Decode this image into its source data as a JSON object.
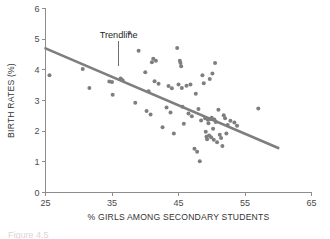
{
  "figure": {
    "caption_clipped": "Figure 4.5"
  },
  "chart_data": {
    "type": "scatter",
    "title": "",
    "xlabel": "% GIRLS AMONG SECONDARY STUDENTS",
    "ylabel": "BIRTH RATES (%)",
    "xlim": [
      25,
      65
    ],
    "ylim": [
      0,
      6
    ],
    "xticks": [
      25,
      35,
      45,
      55,
      65
    ],
    "yticks": [
      0,
      1,
      2,
      3,
      4,
      5,
      6
    ],
    "grid": false,
    "legend": null,
    "marker_color": "#7e7e80",
    "trendline_color": "#7e7e80",
    "axis_color": "#8d8d8d",
    "annotations": [
      {
        "label": "Trendline",
        "x": 36.0,
        "y": 5.05,
        "leader_to_x": 36.0,
        "leader_to_y": 4.12
      }
    ],
    "trendline": {
      "x": [
        25.0,
        60.0
      ],
      "y": [
        4.7,
        1.45
      ]
    },
    "points": [
      {
        "x": 25.6,
        "y": 3.82
      },
      {
        "x": 30.6,
        "y": 4.03
      },
      {
        "x": 31.6,
        "y": 3.41
      },
      {
        "x": 34.6,
        "y": 3.62
      },
      {
        "x": 35.0,
        "y": 3.6
      },
      {
        "x": 35.1,
        "y": 3.19
      },
      {
        "x": 36.3,
        "y": 3.72
      },
      {
        "x": 36.6,
        "y": 3.66
      },
      {
        "x": 37.6,
        "y": 5.21
      },
      {
        "x": 38.5,
        "y": 2.93
      },
      {
        "x": 39.0,
        "y": 4.62
      },
      {
        "x": 40.0,
        "y": 3.92
      },
      {
        "x": 40.2,
        "y": 2.66
      },
      {
        "x": 40.5,
        "y": 3.3
      },
      {
        "x": 40.8,
        "y": 2.54
      },
      {
        "x": 41.0,
        "y": 4.25
      },
      {
        "x": 41.2,
        "y": 4.36
      },
      {
        "x": 41.4,
        "y": 3.63
      },
      {
        "x": 41.6,
        "y": 4.3
      },
      {
        "x": 42.0,
        "y": 3.55
      },
      {
        "x": 42.6,
        "y": 2.13
      },
      {
        "x": 43.2,
        "y": 2.77
      },
      {
        "x": 43.5,
        "y": 3.47
      },
      {
        "x": 43.8,
        "y": 2.61
      },
      {
        "x": 44.0,
        "y": 3.4
      },
      {
        "x": 44.3,
        "y": 1.92
      },
      {
        "x": 44.8,
        "y": 4.71
      },
      {
        "x": 45.0,
        "y": 3.52
      },
      {
        "x": 45.2,
        "y": 4.3
      },
      {
        "x": 45.3,
        "y": 4.22
      },
      {
        "x": 45.4,
        "y": 4.12
      },
      {
        "x": 45.5,
        "y": 3.41
      },
      {
        "x": 45.6,
        "y": 2.8
      },
      {
        "x": 45.8,
        "y": 2.24
      },
      {
        "x": 46.2,
        "y": 3.48
      },
      {
        "x": 46.5,
        "y": 2.58
      },
      {
        "x": 46.8,
        "y": 3.52
      },
      {
        "x": 47.0,
        "y": 2.49
      },
      {
        "x": 47.4,
        "y": 1.43
      },
      {
        "x": 47.6,
        "y": 3.22
      },
      {
        "x": 47.8,
        "y": 1.33
      },
      {
        "x": 48.0,
        "y": 2.72
      },
      {
        "x": 48.2,
        "y": 1.02
      },
      {
        "x": 48.4,
        "y": 2.35
      },
      {
        "x": 48.6,
        "y": 3.82
      },
      {
        "x": 48.8,
        "y": 3.56
      },
      {
        "x": 49.0,
        "y": 2.42
      },
      {
        "x": 49.1,
        "y": 1.98
      },
      {
        "x": 49.2,
        "y": 1.82
      },
      {
        "x": 49.3,
        "y": 1.74
      },
      {
        "x": 49.4,
        "y": 2.37
      },
      {
        "x": 49.5,
        "y": 2.26
      },
      {
        "x": 49.6,
        "y": 1.86
      },
      {
        "x": 49.7,
        "y": 3.7
      },
      {
        "x": 49.8,
        "y": 2.4
      },
      {
        "x": 49.9,
        "y": 1.8
      },
      {
        "x": 50.0,
        "y": 2.44
      },
      {
        "x": 50.1,
        "y": 3.88
      },
      {
        "x": 50.2,
        "y": 2.08
      },
      {
        "x": 50.3,
        "y": 1.72
      },
      {
        "x": 50.4,
        "y": 2.38
      },
      {
        "x": 50.5,
        "y": 4.22
      },
      {
        "x": 50.6,
        "y": 2.3
      },
      {
        "x": 50.8,
        "y": 1.64
      },
      {
        "x": 51.0,
        "y": 2.7
      },
      {
        "x": 51.2,
        "y": 1.88
      },
      {
        "x": 51.4,
        "y": 1.78
      },
      {
        "x": 51.6,
        "y": 1.52
      },
      {
        "x": 51.8,
        "y": 2.52
      },
      {
        "x": 52.0,
        "y": 2.42
      },
      {
        "x": 52.2,
        "y": 1.92
      },
      {
        "x": 52.4,
        "y": 2.2
      },
      {
        "x": 52.8,
        "y": 2.34
      },
      {
        "x": 53.4,
        "y": 2.28
      },
      {
        "x": 53.8,
        "y": 2.18
      },
      {
        "x": 57.0,
        "y": 2.74
      }
    ]
  }
}
